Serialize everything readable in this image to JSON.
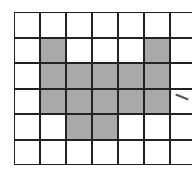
{
  "grid": {
    "rows": 6,
    "cols": 7,
    "shaded_color": "#a9a9a9",
    "line_color": "#222222",
    "shaded_cells": [
      [
        1,
        1
      ],
      [
        1,
        5
      ],
      [
        2,
        1
      ],
      [
        2,
        2
      ],
      [
        2,
        3
      ],
      [
        2,
        4
      ],
      [
        2,
        5
      ],
      [
        3,
        1
      ],
      [
        3,
        2
      ],
      [
        3,
        3
      ],
      [
        3,
        4
      ],
      [
        3,
        5
      ],
      [
        4,
        2
      ],
      [
        4,
        3
      ]
    ]
  },
  "annotation": {
    "type": "pen-stroke"
  }
}
